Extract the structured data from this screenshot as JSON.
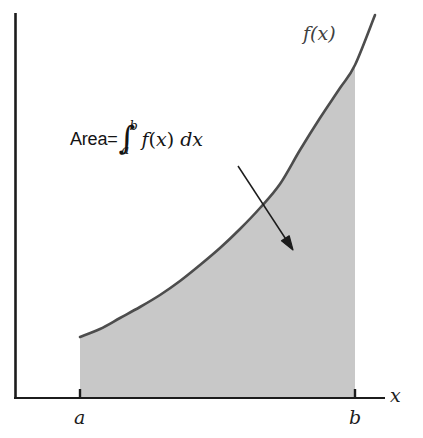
{
  "figure": {
    "title_text": "",
    "background_color": "#ffffff",
    "axis_color": "#1c1c1c",
    "curve_color": "#4d4d4d",
    "fill_color": "#c8c8c8",
    "arrow_color": "#1c1c1c"
  },
  "labels": {
    "function_label": "f(x)",
    "x_axis_label": "x",
    "lower_limit": "a",
    "upper_limit": "b",
    "area_word": "Area=",
    "integral_sign": "∫",
    "integral_upper": "b",
    "integral_lower": "a",
    "integrand_f": "f",
    "integrand_open_paren": "(",
    "integrand_var": "x",
    "integrand_close_paren": ")",
    "differential": "dx"
  },
  "chart_data": {
    "type": "area",
    "title": "",
    "xlabel": "x",
    "ylabel": "",
    "grid": false,
    "legend": null,
    "annotations": [
      {
        "name": "area-formula",
        "text": "Area=∫_a^b f(x) dx",
        "x": 70,
        "y": 139
      },
      {
        "name": "curve-label",
        "text": "f(x)",
        "x": 303,
        "y": 34
      }
    ],
    "axes": {
      "x_axis": {
        "x_start": 15,
        "x_end": 385,
        "y": 398
      },
      "y_axis": {
        "y_start": 13,
        "y_end": 398,
        "x": 15
      }
    },
    "ticks": [
      {
        "label": "a",
        "x": 80
      },
      {
        "label": "b",
        "x": 355
      }
    ],
    "shaded_region": {
      "x_from_label": "a",
      "x_to_label": "b",
      "x_from": 80,
      "x_to": 355,
      "baseline_y": 398,
      "fill": "#c8c8c8"
    },
    "curve_points": [
      [
        80,
        337
      ],
      [
        100,
        329
      ],
      [
        120,
        318
      ],
      [
        140,
        307
      ],
      [
        160,
        295
      ],
      [
        180,
        281
      ],
      [
        200,
        265
      ],
      [
        220,
        248
      ],
      [
        240,
        229
      ],
      [
        260,
        208
      ],
      [
        280,
        184
      ],
      [
        300,
        150
      ],
      [
        320,
        118
      ],
      [
        340,
        88
      ],
      [
        355,
        65
      ],
      [
        375,
        15
      ]
    ],
    "curve_points_extension": [
      [
        355,
        65
      ],
      [
        375,
        15
      ]
    ],
    "arrow": {
      "x1": 238,
      "y1": 166,
      "x2": 293,
      "y2": 250
    }
  }
}
